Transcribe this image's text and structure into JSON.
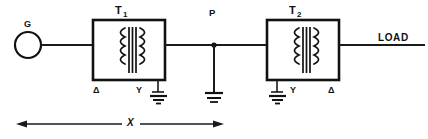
{
  "diagram": {
    "background_color": "#ffffff",
    "line_color": "#111111",
    "source": {
      "label": "G",
      "name": "generator"
    },
    "transformers": [
      {
        "id": "T1",
        "label_main": "T",
        "label_sub": "1",
        "primary_winding": "Δ",
        "secondary_winding": "Y",
        "secondary_grounded": true
      },
      {
        "id": "T2",
        "label_main": "T",
        "label_sub": "2",
        "primary_winding": "Y",
        "secondary_winding": "Δ",
        "primary_grounded": true
      }
    ],
    "nodes": [
      {
        "label": "P",
        "name": "fault-point",
        "grounded": true
      }
    ],
    "load": {
      "label": "LOAD"
    },
    "dimension": {
      "label": "X",
      "style": "double-headed-arrow"
    }
  }
}
